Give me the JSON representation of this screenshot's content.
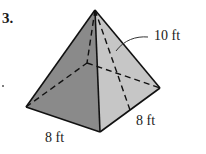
{
  "problem": {
    "number": "3."
  },
  "figure": {
    "type": "square pyramid",
    "labels": {
      "slant_height": "10 ft",
      "base_left": "8 ft",
      "base_right": "8 ft"
    },
    "colors": {
      "left_face": "#8a8a8a",
      "right_face": "#c6c6c6",
      "edge": "#111111",
      "background": "#ffffff"
    },
    "vertices": {
      "apex": [
        95,
        10
      ],
      "base_left": [
        26,
        107
      ],
      "base_front": [
        100,
        132
      ],
      "base_right": [
        160,
        88
      ],
      "base_back": [
        87,
        63
      ]
    }
  }
}
